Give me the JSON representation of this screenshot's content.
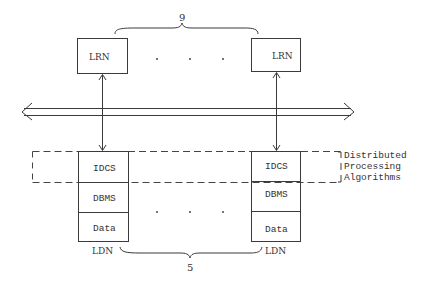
{
  "diagram": {
    "top_nodes": [
      {
        "label": "LRN"
      },
      {
        "label": "LRN"
      }
    ],
    "top_count": "9",
    "bottom_nodes": [
      {
        "layers": [
          "IDCS",
          "DBMS",
          "Data"
        ],
        "label": "LDN"
      },
      {
        "layers": [
          "IDCS",
          "DBMS",
          "Data"
        ],
        "label": "LDN"
      }
    ],
    "bottom_count": "5",
    "group_label": [
      "Distributed",
      "Processing",
      "Algorithms"
    ],
    "ellipsis_dots": 3,
    "colors": {
      "stroke": "#3a3a3a",
      "text": "#333333",
      "background": "#ffffff"
    }
  }
}
